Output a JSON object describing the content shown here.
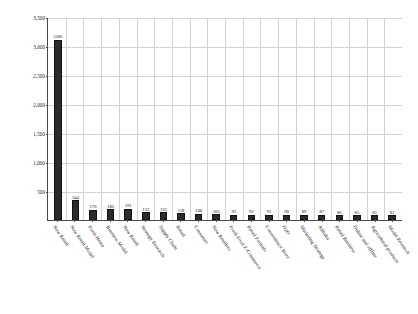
{
  "chart_data": {
    "type": "bar",
    "title": "",
    "xlabel": "",
    "ylabel": "Number of Literature",
    "ylim": [
      0,
      3500
    ],
    "ytick_values": [
      0,
      500,
      1000,
      1500,
      2000,
      2500,
      3000,
      3500
    ],
    "ytick_labels": [
      "",
      "500",
      "1,000",
      "1,500",
      "2,000",
      "2,500",
      "3,000",
      "3,500"
    ],
    "grid": true,
    "legend": "none",
    "bar_color": "#2b2b2b",
    "categories": [
      "New Retail",
      "New Retail Model",
      "Fresh Hema",
      "Business Model",
      "New Retail",
      "Strategy Research",
      "Supply Chain",
      "Retail",
      "Consumer",
      "New Retailers",
      "Fresh Food E-Commerce",
      "Retail Formats",
      "Convenience Store",
      "O2O",
      "Marketing Strategy",
      "Alibaba",
      "Retail Business",
      "Online and offline",
      "Agricultural products",
      "Model Research"
    ],
    "values": [
      3106,
      344,
      176,
      182,
      191,
      132,
      132,
      118,
      108,
      103,
      93,
      92,
      91,
      90,
      89,
      87,
      86,
      85,
      85,
      81
    ],
    "value_labels": [
      "3106",
      "344",
      "176",
      "182",
      "191",
      "132",
      "132",
      "118",
      "108",
      "103",
      "93",
      "92",
      "91",
      "90",
      "89",
      "87",
      "86",
      "85",
      "85",
      "81"
    ]
  }
}
